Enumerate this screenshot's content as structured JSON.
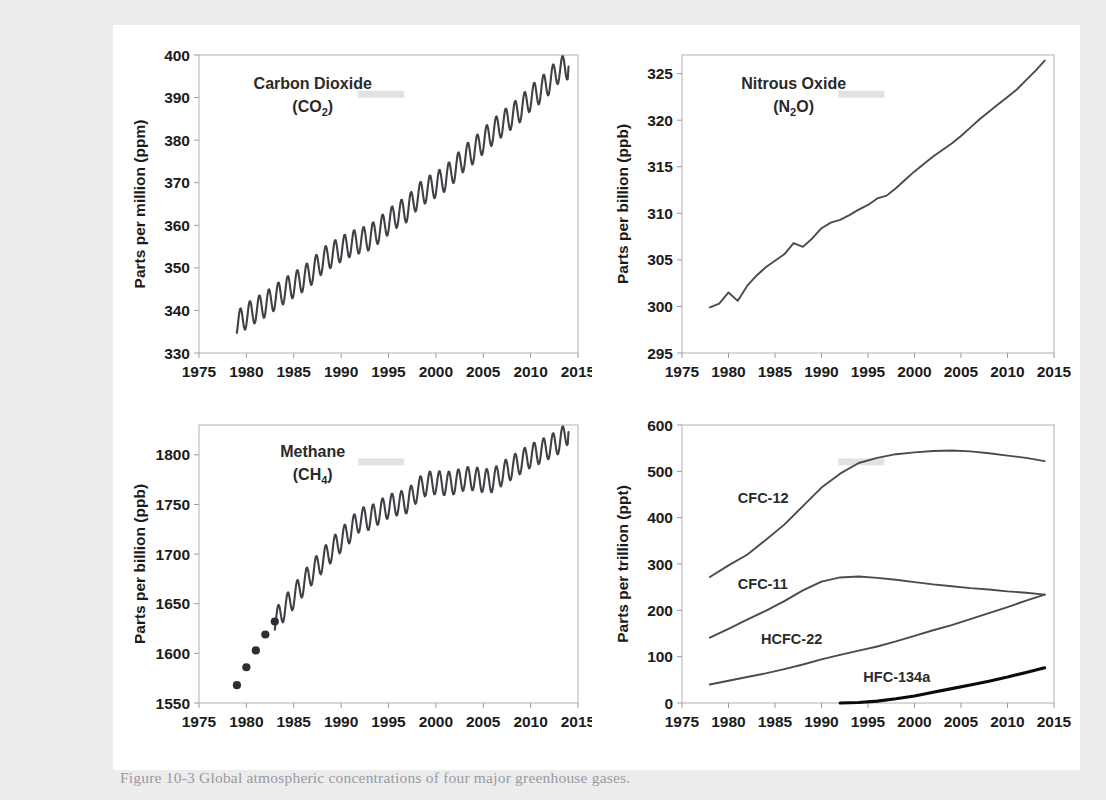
{
  "figure": {
    "caption": "Figure 10-3 Global atmospheric concentrations of four major greenhouse gases.",
    "background_color": "#ececed",
    "sheet_color": "#ffffff"
  },
  "panels": [
    {
      "id": "co2",
      "series_title_line1": "Carbon Dioxide",
      "series_title_line2_pre": "(CO",
      "series_title_line2_sub": "2",
      "series_title_line2_post": ")",
      "ylabel": "Parts per million (ppm)",
      "xlabel": "",
      "yticks": [
        330,
        340,
        350,
        360,
        370,
        380,
        390,
        400
      ],
      "xticks": [
        1975,
        1980,
        1985,
        1990,
        1995,
        2000,
        2005,
        2010,
        2015
      ],
      "ylim": [
        330,
        400
      ],
      "xlim": [
        1975,
        2015
      ],
      "line_color": "#404046"
    },
    {
      "id": "n2o",
      "series_title_line1": "Nitrous Oxide",
      "series_title_line2_pre": "(N",
      "series_title_line2_sub": "2",
      "series_title_line2_post": "O)",
      "ylabel": "Parts per billion (ppb)",
      "xlabel": "",
      "yticks": [
        295,
        300,
        305,
        310,
        315,
        320,
        325
      ],
      "xticks": [
        1975,
        1980,
        1985,
        1990,
        1995,
        2000,
        2005,
        2010,
        2015
      ],
      "ylim": [
        295,
        327
      ],
      "xlim": [
        1975,
        2015
      ],
      "line_color": "#404046"
    },
    {
      "id": "ch4",
      "series_title_line1": "Methane",
      "series_title_line2_pre": "(CH",
      "series_title_line2_sub": "4",
      "series_title_line2_post": ")",
      "ylabel": "Parts per billion (ppb)",
      "xlabel": "",
      "yticks": [
        1550,
        1600,
        1650,
        1700,
        1750,
        1800
      ],
      "xticks": [
        1975,
        1980,
        1985,
        1990,
        1995,
        2000,
        2005,
        2010,
        2015
      ],
      "ylim": [
        1550,
        1830
      ],
      "xlim": [
        1975,
        2015
      ],
      "line_color": "#404046"
    },
    {
      "id": "halocarbons",
      "series_title_line1": "",
      "series_title_line2_pre": "",
      "series_title_line2_sub": "",
      "series_title_line2_post": "",
      "ylabel": "Parts per trillion (ppt)",
      "xlabel": "",
      "yticks": [
        0,
        100,
        200,
        300,
        400,
        500,
        600
      ],
      "xticks": [
        1975,
        1980,
        1985,
        1990,
        1995,
        2000,
        2005,
        2010,
        2015
      ],
      "ylim": [
        0,
        600
      ],
      "xlim": [
        1975,
        2015
      ],
      "inline_labels": [
        {
          "text": "CFC-12",
          "x": 1981.0,
          "y": 432
        },
        {
          "text": "CFC-11",
          "x": 1981.0,
          "y": 247
        },
        {
          "text": "HCFC-22",
          "x": 1983.5,
          "y": 128
        },
        {
          "text": "HFC-134a",
          "x": 1994.5,
          "y": 46
        }
      ]
    }
  ],
  "chart_data": [
    {
      "type": "line",
      "id": "co2",
      "title": "Carbon Dioxide (CO2)",
      "xlabel": "Year",
      "ylabel": "Parts per million (ppm)",
      "xlim": [
        1975,
        2015
      ],
      "ylim": [
        330,
        400
      ],
      "grid": false,
      "legend": "inside-label",
      "note": "Monthly Mauna Loa record with seasonal sawtooth; annual mean values listed below",
      "seasonal_amplitude_ppm": 3.0,
      "x": [
        1979,
        1980,
        1981,
        1982,
        1983,
        1984,
        1985,
        1986,
        1987,
        1988,
        1989,
        1990,
        1991,
        1992,
        1993,
        1994,
        1995,
        1996,
        1997,
        1998,
        1999,
        2000,
        2001,
        2002,
        2003,
        2004,
        2005,
        2006,
        2007,
        2008,
        2009,
        2010,
        2011,
        2012,
        2013,
        2014
      ],
      "values": [
        336.8,
        338.7,
        340.1,
        341.4,
        343.0,
        344.6,
        346.0,
        347.4,
        349.2,
        351.6,
        353.1,
        354.4,
        355.6,
        356.4,
        357.1,
        358.8,
        360.8,
        362.6,
        363.8,
        366.6,
        368.3,
        369.5,
        371.0,
        373.2,
        375.8,
        377.5,
        379.8,
        381.9,
        383.8,
        385.6,
        387.4,
        389.9,
        391.6,
        393.8,
        396.5,
        397.3
      ]
    },
    {
      "type": "line",
      "id": "n2o",
      "title": "Nitrous Oxide (N2O)",
      "xlabel": "Year",
      "ylabel": "Parts per billion (ppb)",
      "xlim": [
        1975,
        2015
      ],
      "ylim": [
        295,
        327
      ],
      "grid": false,
      "legend": "inside-label",
      "note": "Smoothly rising global mean with small interannual wiggles",
      "x": [
        1978,
        1979,
        1980,
        1981,
        1982,
        1983,
        1984,
        1985,
        1986,
        1987,
        1988,
        1989,
        1990,
        1991,
        1992,
        1993,
        1994,
        1995,
        1996,
        1997,
        1998,
        1999,
        2000,
        2001,
        2002,
        2003,
        2004,
        2005,
        2006,
        2007,
        2008,
        2009,
        2010,
        2011,
        2012,
        2013,
        2014
      ],
      "values": [
        299.9,
        300.3,
        301.5,
        300.6,
        302.2,
        303.3,
        304.2,
        304.9,
        305.6,
        306.8,
        306.4,
        307.3,
        308.4,
        309.0,
        309.3,
        309.8,
        310.4,
        310.9,
        311.6,
        311.9,
        312.7,
        313.6,
        314.5,
        315.3,
        316.1,
        316.8,
        317.5,
        318.3,
        319.2,
        320.1,
        320.9,
        321.7,
        322.5,
        323.3,
        324.3,
        325.3,
        326.4
      ]
    },
    {
      "type": "line",
      "id": "ch4",
      "title": "Methane (CH4)",
      "xlabel": "Year",
      "ylabel": "Parts per billion (ppb)",
      "xlim": [
        1975,
        2015
      ],
      "ylim": [
        1550,
        1830
      ],
      "grid": false,
      "legend": "inside-label",
      "note": "Five discrete early markers (1979-1983) then continuous monthly record with seasonal cycle",
      "seasonal_amplitude_ppb": 12,
      "markers_x": [
        1979,
        1980,
        1981,
        1982,
        1983
      ],
      "markers_values": [
        1568,
        1586,
        1603,
        1619,
        1632
      ],
      "x": [
        1983,
        1984,
        1985,
        1986,
        1987,
        1988,
        1989,
        1990,
        1991,
        1992,
        1993,
        1994,
        1995,
        1996,
        1997,
        1998,
        1999,
        2000,
        2001,
        2002,
        2003,
        2004,
        2005,
        2006,
        2007,
        2008,
        2009,
        2010,
        2011,
        2012,
        2013,
        2014
      ],
      "values": [
        1632,
        1645,
        1657,
        1670,
        1682,
        1693,
        1704,
        1714,
        1724,
        1735,
        1736,
        1742,
        1748,
        1751,
        1753,
        1764,
        1771,
        1772,
        1771,
        1772,
        1776,
        1776,
        1774,
        1774,
        1781,
        1787,
        1793,
        1799,
        1803,
        1808,
        1813,
        1823
      ]
    },
    {
      "type": "line",
      "id": "halocarbons",
      "title": "Halocarbons",
      "xlabel": "Year",
      "ylabel": "Parts per trillion (ppt)",
      "xlim": [
        1975,
        2015
      ],
      "ylim": [
        0,
        600
      ],
      "grid": false,
      "legend": "inline-labels",
      "series": [
        {
          "name": "CFC-12",
          "x": [
            1978,
            1980,
            1982,
            1984,
            1986,
            1988,
            1990,
            1992,
            1994,
            1996,
            1998,
            2000,
            2002,
            2004,
            2006,
            2008,
            2010,
            2012,
            2014
          ],
          "values": [
            272,
            297,
            320,
            352,
            385,
            425,
            465,
            495,
            518,
            529,
            537,
            541,
            544,
            545,
            543,
            539,
            534,
            529,
            522
          ]
        },
        {
          "name": "CFC-11",
          "x": [
            1978,
            1980,
            1982,
            1984,
            1986,
            1988,
            1990,
            1992,
            1994,
            1996,
            1998,
            2000,
            2002,
            2004,
            2006,
            2008,
            2010,
            2012,
            2014
          ],
          "values": [
            141,
            160,
            180,
            199,
            220,
            243,
            262,
            271,
            273,
            270,
            266,
            261,
            256,
            252,
            248,
            245,
            241,
            238,
            234
          ]
        },
        {
          "name": "HCFC-22",
          "x": [
            1978,
            1980,
            1982,
            1984,
            1986,
            1988,
            1990,
            1992,
            1994,
            1996,
            1998,
            2000,
            2002,
            2004,
            2006,
            2008,
            2010,
            2012,
            2014
          ],
          "values": [
            40,
            48,
            56,
            64,
            73,
            83,
            94,
            104,
            113,
            122,
            133,
            145,
            157,
            168,
            181,
            194,
            207,
            221,
            234
          ]
        },
        {
          "name": "HFC-134a",
          "x": [
            1992,
            1994,
            1996,
            1998,
            2000,
            2002,
            2004,
            2006,
            2008,
            2010,
            2012,
            2014
          ],
          "values": [
            0,
            1,
            4,
            9,
            15,
            23,
            31,
            39,
            47,
            56,
            66,
            76
          ]
        }
      ]
    }
  ]
}
